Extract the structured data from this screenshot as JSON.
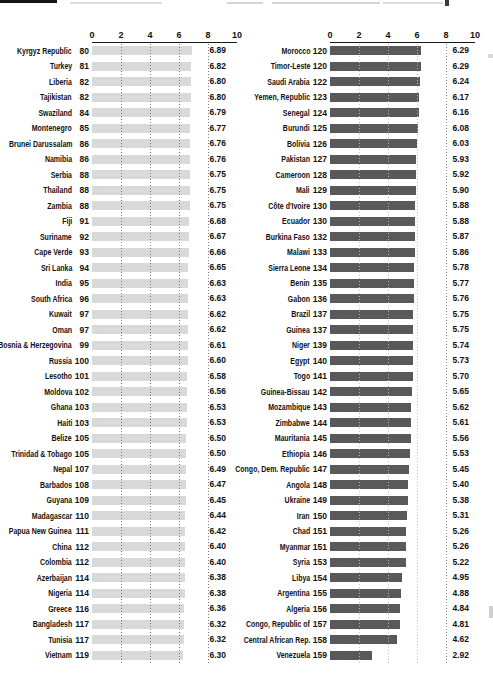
{
  "page": {
    "background_color": "#ffffff"
  },
  "chart_data": [
    {
      "type": "bar",
      "orientation": "horizontal",
      "panel": "left",
      "bar_color": "#d9d9d9",
      "axis": {
        "min": 0,
        "max": 10,
        "ticks": [
          "0",
          "2",
          "4",
          "6",
          "8",
          "10"
        ],
        "gridlines_at": [
          2,
          4,
          6,
          8
        ]
      },
      "rows": [
        {
          "country": "Kyrgyz Republic",
          "rank": "80",
          "value": "6.89"
        },
        {
          "country": "Turkey",
          "rank": "81",
          "value": "6.82"
        },
        {
          "country": "Liberia",
          "rank": "82",
          "value": "6.80"
        },
        {
          "country": "Tajikistan",
          "rank": "82",
          "value": "6.80"
        },
        {
          "country": "Swaziland",
          "rank": "84",
          "value": "6.79"
        },
        {
          "country": "Montenegro",
          "rank": "85",
          "value": "6.77"
        },
        {
          "country": "Brunei Darussalam",
          "rank": "86",
          "value": "6.76"
        },
        {
          "country": "Namibia",
          "rank": "86",
          "value": "6.76"
        },
        {
          "country": "Serbia",
          "rank": "88",
          "value": "6.75"
        },
        {
          "country": "Thailand",
          "rank": "88",
          "value": "6.75"
        },
        {
          "country": "Zambia",
          "rank": "88",
          "value": "6.75"
        },
        {
          "country": "Fiji",
          "rank": "91",
          "value": "6.68"
        },
        {
          "country": "Suriname",
          "rank": "92",
          "value": "6.67"
        },
        {
          "country": "Cape Verde",
          "rank": "93",
          "value": "6.66"
        },
        {
          "country": "Sri Lanka",
          "rank": "94",
          "value": "6.65"
        },
        {
          "country": "India",
          "rank": "95",
          "value": "6.63"
        },
        {
          "country": "South Africa",
          "rank": "96",
          "value": "6.63"
        },
        {
          "country": "Kuwait",
          "rank": "97",
          "value": "6.62"
        },
        {
          "country": "Oman",
          "rank": "97",
          "value": "6.62"
        },
        {
          "country": "Bosnia & Herzegovina",
          "rank": "99",
          "value": "6.61"
        },
        {
          "country": "Russia",
          "rank": "100",
          "value": "6.60"
        },
        {
          "country": "Lesotho",
          "rank": "101",
          "value": "6.58"
        },
        {
          "country": "Moldova",
          "rank": "102",
          "value": "6.56"
        },
        {
          "country": "Ghana",
          "rank": "103",
          "value": "6.53"
        },
        {
          "country": "Haiti",
          "rank": "103",
          "value": "6.53"
        },
        {
          "country": "Belize",
          "rank": "105",
          "value": "6.50"
        },
        {
          "country": "Trinidad & Tobago",
          "rank": "105",
          "value": "6.50"
        },
        {
          "country": "Nepal",
          "rank": "107",
          "value": "6.49"
        },
        {
          "country": "Barbados",
          "rank": "108",
          "value": "6.47"
        },
        {
          "country": "Guyana",
          "rank": "109",
          "value": "6.45"
        },
        {
          "country": "Madagascar",
          "rank": "110",
          "value": "6.44"
        },
        {
          "country": "Papua New Guinea",
          "rank": "111",
          "value": "6.42"
        },
        {
          "country": "China",
          "rank": "112",
          "value": "6.40"
        },
        {
          "country": "Colombia",
          "rank": "112",
          "value": "6.40"
        },
        {
          "country": "Azerbaijan",
          "rank": "114",
          "value": "6.38"
        },
        {
          "country": "Nigeria",
          "rank": "114",
          "value": "6.38"
        },
        {
          "country": "Greece",
          "rank": "116",
          "value": "6.36"
        },
        {
          "country": "Bangladesh",
          "rank": "117",
          "value": "6.32"
        },
        {
          "country": "Tunisia",
          "rank": "117",
          "value": "6.32"
        },
        {
          "country": "Vietnam",
          "rank": "119",
          "value": "6.30"
        }
      ]
    },
    {
      "type": "bar",
      "orientation": "horizontal",
      "panel": "right",
      "bar_color": "#595959",
      "axis": {
        "min": 0,
        "max": 10,
        "ticks": [
          "0",
          "2",
          "4",
          "6",
          "8",
          "10"
        ],
        "gridlines_at": [
          2,
          4,
          6,
          8
        ]
      },
      "rows": [
        {
          "country": "Morocco",
          "rank": "120",
          "value": "6.29"
        },
        {
          "country": "Timor-Leste",
          "rank": "120",
          "value": "6.29"
        },
        {
          "country": "Saudi Arabia",
          "rank": "122",
          "value": "6.24"
        },
        {
          "country": "Yemen, Republic",
          "rank": "123",
          "value": "6.17"
        },
        {
          "country": "Senegal",
          "rank": "124",
          "value": "6.16"
        },
        {
          "country": "Burundi",
          "rank": "125",
          "value": "6.08"
        },
        {
          "country": "Bolivia",
          "rank": "126",
          "value": "6.03"
        },
        {
          "country": "Pakistan",
          "rank": "127",
          "value": "5.93"
        },
        {
          "country": "Cameroon",
          "rank": "128",
          "value": "5.92"
        },
        {
          "country": "Mali",
          "rank": "129",
          "value": "5.90"
        },
        {
          "country": "Côte d'Ivoire",
          "rank": "130",
          "value": "5.88"
        },
        {
          "country": "Ecuador",
          "rank": "130",
          "value": "5.88"
        },
        {
          "country": "Burkina Faso",
          "rank": "132",
          "value": "5.87"
        },
        {
          "country": "Malawi",
          "rank": "133",
          "value": "5.86"
        },
        {
          "country": "Sierra Leone",
          "rank": "134",
          "value": "5.78"
        },
        {
          "country": "Benin",
          "rank": "135",
          "value": "5.77"
        },
        {
          "country": "Gabon",
          "rank": "136",
          "value": "5.76"
        },
        {
          "country": "Brazil",
          "rank": "137",
          "value": "5.75"
        },
        {
          "country": "Guinea",
          "rank": "137",
          "value": "5.75"
        },
        {
          "country": "Niger",
          "rank": "139",
          "value": "5.74"
        },
        {
          "country": "Egypt",
          "rank": "140",
          "value": "5.73"
        },
        {
          "country": "Togo",
          "rank": "141",
          "value": "5.70"
        },
        {
          "country": "Guinea-Bissau",
          "rank": "142",
          "value": "5.65"
        },
        {
          "country": "Mozambique",
          "rank": "143",
          "value": "5.62"
        },
        {
          "country": "Zimbabwe",
          "rank": "144",
          "value": "5.61"
        },
        {
          "country": "Mauritania",
          "rank": "145",
          "value": "5.56"
        },
        {
          "country": "Ethiopia",
          "rank": "146",
          "value": "5.53"
        },
        {
          "country": "Congo, Dem. Republic",
          "rank": "147",
          "value": "5.45"
        },
        {
          "country": "Angola",
          "rank": "148",
          "value": "5.40"
        },
        {
          "country": "Ukraine",
          "rank": "149",
          "value": "5.38"
        },
        {
          "country": "Iran",
          "rank": "150",
          "value": "5.31"
        },
        {
          "country": "Chad",
          "rank": "151",
          "value": "5.26"
        },
        {
          "country": "Myanmar",
          "rank": "151",
          "value": "5.26"
        },
        {
          "country": "Syria",
          "rank": "153",
          "value": "5.22"
        },
        {
          "country": "Libya",
          "rank": "154",
          "value": "4.95"
        },
        {
          "country": "Argentina",
          "rank": "155",
          "value": "4.88"
        },
        {
          "country": "Algeria",
          "rank": "156",
          "value": "4.84"
        },
        {
          "country": "Congo, Republic of",
          "rank": "157",
          "value": "4.81"
        },
        {
          "country": "Central African Rep.",
          "rank": "158",
          "value": "4.62"
        },
        {
          "country": "Venezuela",
          "rank": "159",
          "value": "2.92"
        }
      ]
    }
  ]
}
